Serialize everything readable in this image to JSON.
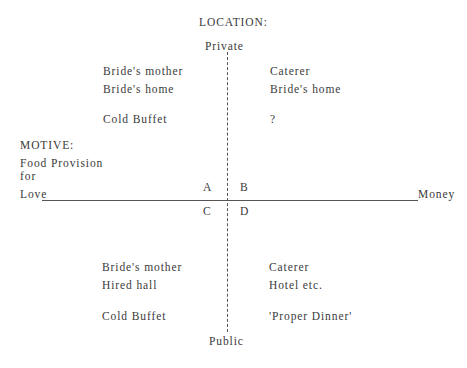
{
  "diagram": {
    "location_heading": "LOCATION:",
    "axis_top": "Private",
    "axis_bottom": "Public",
    "motive_heading": "MOTIVE:",
    "motive_line1": "Food Provision",
    "motive_line2": "for",
    "axis_left": "Love",
    "axis_right": "Money",
    "quadrants": {
      "A": {
        "label": "A",
        "provider": "Bride's mother",
        "location": "Bride's home",
        "food": "Cold Buffet"
      },
      "B": {
        "label": "B",
        "provider": "Caterer",
        "location": "Bride's home",
        "food": "?"
      },
      "C": {
        "label": "C",
        "provider": "Bride's mother",
        "location": "Hired hall",
        "food": "Cold Buffet"
      },
      "D": {
        "label": "D",
        "provider": "Caterer",
        "location": "Hotel etc.",
        "food": "'Proper Dinner'"
      }
    }
  }
}
